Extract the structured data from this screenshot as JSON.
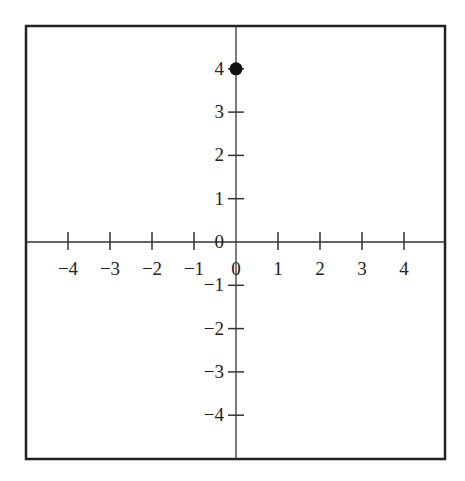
{
  "chart_data": {
    "type": "scatter",
    "title": "",
    "xlabel": "",
    "ylabel": "",
    "xlim": [
      -5,
      5
    ],
    "ylim": [
      -5,
      5
    ],
    "grid": false,
    "x_ticks": [
      -4,
      -3,
      -2,
      -1,
      0,
      1,
      2,
      3,
      4
    ],
    "y_ticks": [
      -4,
      -3,
      -2,
      -1,
      0,
      1,
      2,
      3,
      4
    ],
    "x_tick_labels": [
      "−4",
      "−3",
      "−2",
      "−1",
      "0",
      "1",
      "2",
      "3",
      "4"
    ],
    "y_tick_labels": [
      "−4",
      "−3",
      "−2",
      "−1",
      "0",
      "1",
      "2",
      "3",
      "4"
    ],
    "points": [
      {
        "x": 0,
        "y": 4
      }
    ],
    "colors": {
      "axis": "#333333",
      "point": "#111111",
      "frame": "#222222"
    }
  }
}
